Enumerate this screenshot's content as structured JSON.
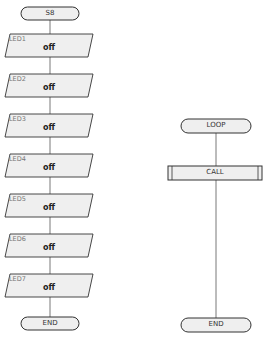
{
  "flow_left": {
    "start": "S8",
    "steps": [
      {
        "name": "LED1",
        "value": "off"
      },
      {
        "name": "LED2",
        "value": "off"
      },
      {
        "name": "LED3",
        "value": "off"
      },
      {
        "name": "LED4",
        "value": "off"
      },
      {
        "name": "LED5",
        "value": "off"
      },
      {
        "name": "LED6",
        "value": "off"
      },
      {
        "name": "LED7",
        "value": "off"
      }
    ],
    "end": "END"
  },
  "flow_right": {
    "start": "LOOP",
    "call": "CALL",
    "end": "END"
  },
  "colors": {
    "shape_fill": "#efefef",
    "stroke": "#333333",
    "connector": "#555555"
  }
}
